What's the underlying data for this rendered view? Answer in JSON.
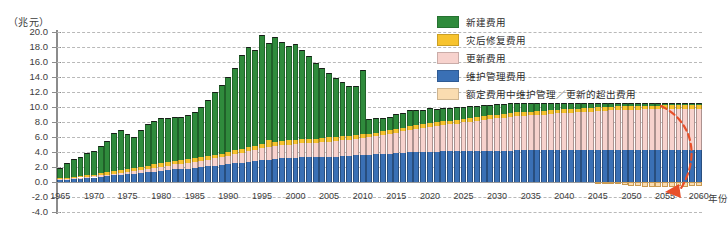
{
  "unit_label": "（兆元）",
  "legend": {
    "items": [
      {
        "label": "新建费用",
        "color": "#2f8b3c"
      },
      {
        "label": "灾后修复费用",
        "color": "#f7c32e"
      },
      {
        "label": "更新费用",
        "color": "#f7d2cd"
      },
      {
        "label": "维护管理费用",
        "color": "#3a70b5"
      },
      {
        "label": "额定费用中维护管理／更新的超出费用",
        "color": "#fadcb0"
      }
    ]
  },
  "annotation": {
    "arrow_color": "#e8502a",
    "name": "shortfall-arrow"
  },
  "chart_data": {
    "type": "bar",
    "subtype": "stacked",
    "title": "",
    "xlabel": "年份",
    "ylabel": "（兆元）",
    "ylim": [
      -4.0,
      20.0
    ],
    "ytick_step": 2.0,
    "yticks": [
      "20.0",
      "18.0",
      "16.0",
      "14.0",
      "12.0",
      "10.0",
      "8.0",
      "6.0",
      "4.0",
      "2.0",
      "0.0",
      "-2.0",
      "-4.0"
    ],
    "xticks": [
      "1965",
      "1970",
      "1975",
      "1980",
      "1985",
      "1990",
      "1995",
      "2000",
      "2005",
      "2010",
      "2015",
      "2020",
      "2025",
      "2030",
      "2035",
      "2040",
      "2045",
      "2050",
      "2055",
      "2060"
    ],
    "xlim": [
      1965,
      2060
    ],
    "grid": true,
    "legend_position": "top-right",
    "series": [
      {
        "name": "维护管理费用",
        "color": "#3a70b5",
        "stack_order": 1
      },
      {
        "name": "更新费用",
        "color": "#f7d2cd",
        "stack_order": 2
      },
      {
        "name": "灾后修复费用",
        "color": "#f7c32e",
        "stack_order": 3
      },
      {
        "name": "新建费用",
        "color": "#2f8b3c",
        "stack_order": 4
      },
      {
        "name": "额定费用中维护管理／更新的超出费用",
        "color": "#fadcb0",
        "stack_order": 0
      }
    ],
    "years": [
      1965,
      1966,
      1967,
      1968,
      1969,
      1970,
      1971,
      1972,
      1973,
      1974,
      1975,
      1976,
      1977,
      1978,
      1979,
      1980,
      1981,
      1982,
      1983,
      1984,
      1985,
      1986,
      1987,
      1988,
      1989,
      1990,
      1991,
      1992,
      1993,
      1994,
      1995,
      1996,
      1997,
      1998,
      1999,
      2000,
      2001,
      2002,
      2003,
      2004,
      2005,
      2006,
      2007,
      2008,
      2009,
      2010,
      2011,
      2012,
      2013,
      2014,
      2015,
      2016,
      2017,
      2018,
      2019,
      2020,
      2021,
      2022,
      2023,
      2024,
      2025,
      2026,
      2027,
      2028,
      2029,
      2030,
      2031,
      2032,
      2033,
      2034,
      2035,
      2036,
      2037,
      2038,
      2039,
      2040,
      2041,
      2042,
      2043,
      2044,
      2045,
      2046,
      2047,
      2048,
      2049,
      2050,
      2051,
      2052,
      2053,
      2054,
      2055,
      2056,
      2057,
      2058,
      2059,
      2060
    ],
    "values": {
      "维护管理费用": [
        0.35,
        0.4,
        0.45,
        0.5,
        0.55,
        0.6,
        0.7,
        0.8,
        0.9,
        1.0,
        1.05,
        1.1,
        1.2,
        1.3,
        1.4,
        1.5,
        1.6,
        1.7,
        1.75,
        1.8,
        1.9,
        2.0,
        2.1,
        2.2,
        2.3,
        2.4,
        2.5,
        2.6,
        2.7,
        2.8,
        2.9,
        3.0,
        3.1,
        3.15,
        3.2,
        3.25,
        3.3,
        3.3,
        3.3,
        3.35,
        3.4,
        3.4,
        3.45,
        3.5,
        3.55,
        3.6,
        3.65,
        3.7,
        3.75,
        3.8,
        3.85,
        3.9,
        3.95,
        4.0,
        4.0,
        4.05,
        4.05,
        4.1,
        4.1,
        4.1,
        4.15,
        4.15,
        4.15,
        4.2,
        4.2,
        4.2,
        4.2,
        4.2,
        4.25,
        4.25,
        4.25,
        4.25,
        4.25,
        4.25,
        4.3,
        4.3,
        4.3,
        4.3,
        4.3,
        4.3,
        4.3,
        4.3,
        4.3,
        4.3,
        4.3,
        4.3,
        4.3,
        4.3,
        4.3,
        4.3,
        4.3,
        4.3,
        4.3,
        4.3,
        4.3,
        4.3
      ],
      "更新费用": [
        0.05,
        0.05,
        0.08,
        0.1,
        0.12,
        0.15,
        0.18,
        0.2,
        0.22,
        0.25,
        0.3,
        0.35,
        0.4,
        0.45,
        0.5,
        0.55,
        0.6,
        0.65,
        0.7,
        0.75,
        0.8,
        0.85,
        0.9,
        0.95,
        1.0,
        1.1,
        1.2,
        1.3,
        1.4,
        1.5,
        1.6,
        1.65,
        1.7,
        1.75,
        1.8,
        1.85,
        1.9,
        1.9,
        1.95,
        2.0,
        2.0,
        2.05,
        2.1,
        2.15,
        2.2,
        2.25,
        2.3,
        2.4,
        2.5,
        2.6,
        2.7,
        2.85,
        3.0,
        3.1,
        3.2,
        3.3,
        3.4,
        3.5,
        3.6,
        3.7,
        3.8,
        3.9,
        4.0,
        4.1,
        4.2,
        4.3,
        4.4,
        4.5,
        4.55,
        4.6,
        4.65,
        4.7,
        4.75,
        4.8,
        4.85,
        4.9,
        4.95,
        5.0,
        5.05,
        5.1,
        5.15,
        5.2,
        5.25,
        5.3,
        5.3,
        5.35,
        5.35,
        5.4,
        5.4,
        5.4,
        5.45,
        5.45,
        5.45,
        5.45,
        5.45,
        5.45
      ],
      "灾后修复费用": [
        0.15,
        0.15,
        0.2,
        0.2,
        0.25,
        0.25,
        0.3,
        0.3,
        0.35,
        0.35,
        0.4,
        0.4,
        0.45,
        0.45,
        0.5,
        0.5,
        0.5,
        0.5,
        0.5,
        0.5,
        0.5,
        0.5,
        0.5,
        0.5,
        0.5,
        0.55,
        0.55,
        0.55,
        0.55,
        0.55,
        0.55,
        0.9,
        0.55,
        0.55,
        0.55,
        0.55,
        0.55,
        0.55,
        0.55,
        0.55,
        0.55,
        0.55,
        0.55,
        0.55,
        0.55,
        0.55,
        0.5,
        0.5,
        0.5,
        0.5,
        0.5,
        0.5,
        0.5,
        0.5,
        0.5,
        0.5,
        0.5,
        0.5,
        0.5,
        0.5,
        0.5,
        0.5,
        0.5,
        0.5,
        0.5,
        0.5,
        0.5,
        0.5,
        0.5,
        0.5,
        0.5,
        0.5,
        0.5,
        0.5,
        0.5,
        0.5,
        0.5,
        0.5,
        0.5,
        0.5,
        0.5,
        0.5,
        0.5,
        0.5,
        0.5,
        0.5,
        0.5,
        0.5,
        0.5,
        0.5,
        0.5,
        0.5,
        0.5,
        0.5,
        0.5,
        0.5
      ],
      "新建费用": [
        1.3,
        1.9,
        2.4,
        2.6,
        3.0,
        3.2,
        3.6,
        4.2,
        5.0,
        5.3,
        4.6,
        4.2,
        4.9,
        5.5,
        5.8,
        6.0,
        5.9,
        5.8,
        5.7,
        5.9,
        6.2,
        6.7,
        7.4,
        8.3,
        9.2,
        10.0,
        11.0,
        12.5,
        13.4,
        12.8,
        14.5,
        13.0,
        14.0,
        13.2,
        12.6,
        12.8,
        11.9,
        11.0,
        10.1,
        9.3,
        8.6,
        7.9,
        7.2,
        6.6,
        6.5,
        8.5,
        1.9,
        1.9,
        1.8,
        1.8,
        2.0,
        1.9,
        2.1,
        2.0,
        1.9,
        2.0,
        1.8,
        1.8,
        1.7,
        1.7,
        1.6,
        1.6,
        1.5,
        1.5,
        1.4,
        1.4,
        1.3,
        1.3,
        1.2,
        1.2,
        1.1,
        1.1,
        1.0,
        1.0,
        0.9,
        0.9,
        0.85,
        0.8,
        0.75,
        0.7,
        0.65,
        0.6,
        0.55,
        0.5,
        0.5,
        0.45,
        0.45,
        0.4,
        0.4,
        0.35,
        0.35,
        0.3,
        0.3,
        0.3,
        0.25,
        0.25
      ],
      "额定费用中维护管理／更新的超出费用": [
        0,
        0,
        0,
        0,
        0,
        0,
        0,
        0,
        0,
        0,
        0,
        0,
        0,
        0,
        0,
        0,
        0,
        0,
        0,
        0,
        0,
        0,
        0,
        0,
        0,
        0,
        0,
        0,
        0,
        0,
        0,
        0,
        0,
        0,
        0,
        0,
        0,
        0,
        0,
        0,
        0,
        0,
        0,
        0,
        0,
        0,
        0,
        0,
        0,
        0,
        0,
        0,
        0,
        0,
        0,
        0,
        0,
        0,
        0,
        0,
        0,
        0,
        0,
        0,
        0,
        0,
        0,
        0,
        0,
        0,
        0,
        0,
        0,
        0,
        0,
        0,
        0,
        0,
        0,
        0,
        -0.05,
        -0.1,
        -0.15,
        -0.25,
        -0.35,
        -0.5,
        -0.55,
        -0.6,
        -0.6,
        -0.65,
        -0.6,
        -0.6,
        -0.55,
        -0.6,
        -0.55,
        -0.5
      ]
    },
    "notes": {
      "peak_year": 1995,
      "peak_total": 19.5,
      "drop_year": 2011,
      "annotation": "红色虚线箭头指向0线以下的超出费用"
    }
  }
}
